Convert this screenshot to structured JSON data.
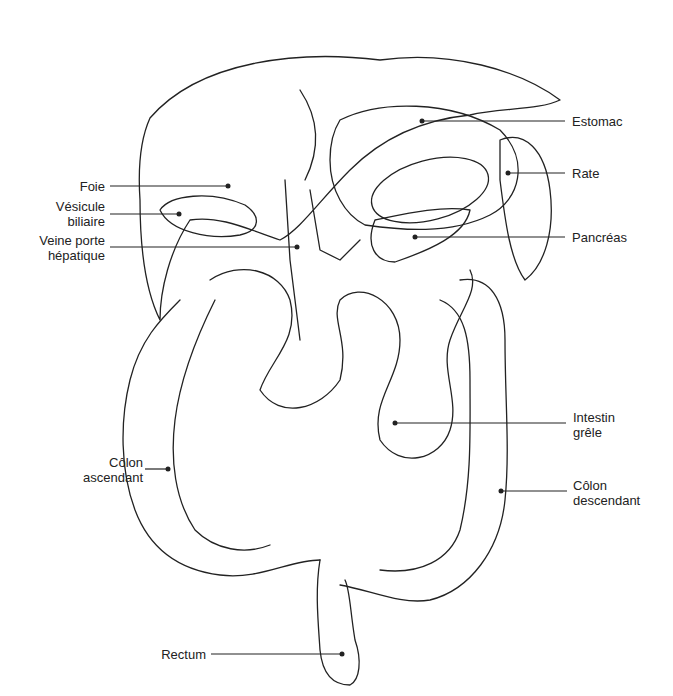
{
  "labels": {
    "foie": "Foie",
    "vesicule_1": "Vésicule",
    "vesicule_2": "biliaire",
    "veine_1": "Veine porte",
    "veine_2": "hépatique",
    "colon_asc_1": "Côlon",
    "colon_asc_2": "ascendant",
    "rectum": "Rectum",
    "estomac": "Estomac",
    "rate": "Rate",
    "pancreas": "Pancréas",
    "intestin_1": "Intestin",
    "intestin_2": "grêle",
    "colon_desc_1": "Côlon",
    "colon_desc_2": "descendant"
  }
}
